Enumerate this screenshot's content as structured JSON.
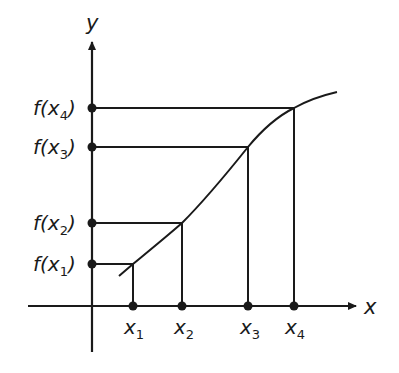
{
  "diagram": {
    "axes": {
      "x_label": "x",
      "y_label": "y",
      "color": "#1a1a1a"
    },
    "points": [
      {
        "x_label": "x",
        "x_sub": "1",
        "fx_label": "f(x",
        "fx_sub": "1",
        "fx_close": ")"
      },
      {
        "x_label": "x",
        "x_sub": "2",
        "fx_label": "f(x",
        "fx_sub": "2",
        "fx_close": ")"
      },
      {
        "x_label": "x",
        "x_sub": "3",
        "fx_label": "f(x",
        "fx_sub": "3",
        "fx_close": ")"
      },
      {
        "x_label": "x",
        "x_sub": "4",
        "fx_label": "f(x",
        "fx_sub": "4",
        "fx_close": ")"
      }
    ],
    "curve": "increasing concave-down function f(x)"
  }
}
